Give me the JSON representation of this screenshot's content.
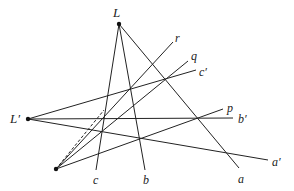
{
  "diagram": {
    "type": "projective-geometry-construction",
    "points": {
      "L": {
        "label": "L",
        "x": 119,
        "y": 24,
        "lx": 113,
        "ly": 17
      },
      "Lp": {
        "label": "L′",
        "x": 28,
        "y": 119,
        "lx": 10,
        "ly": 123
      },
      "O": {
        "label": "",
        "x": 56,
        "y": 169
      }
    },
    "lines": [
      {
        "id": "a",
        "label": "a",
        "from": "L",
        "x2": 239,
        "y2": 168,
        "lx": 238,
        "ly": 183
      },
      {
        "id": "b",
        "label": "b",
        "from": "L",
        "x2": 145,
        "y2": 170,
        "lx": 143,
        "ly": 184
      },
      {
        "id": "c",
        "label": "c",
        "from": "L",
        "x2": 96,
        "y2": 170,
        "lx": 93,
        "ly": 184
      },
      {
        "id": "a_prime",
        "label": "a′",
        "from": "Lp",
        "x2": 268,
        "y2": 160,
        "lx": 272,
        "ly": 166
      },
      {
        "id": "b_prime",
        "label": "b′",
        "from": "Lp",
        "x2": 233,
        "y2": 118,
        "lx": 238,
        "ly": 123
      },
      {
        "id": "c_prime",
        "label": "c′",
        "from": "Lp",
        "x2": 196,
        "y2": 70,
        "lx": 199,
        "ly": 76
      },
      {
        "id": "p",
        "label": "p",
        "from": "O",
        "x2": 223,
        "y2": 109,
        "lx": 227,
        "ly": 112
      },
      {
        "id": "q",
        "label": "q",
        "from": "O",
        "x2": 188,
        "y2": 61,
        "lx": 191,
        "ly": 60
      },
      {
        "id": "r",
        "label": "r",
        "from": "O",
        "x2": 173,
        "y2": 42,
        "lx": 175,
        "ly": 42
      }
    ],
    "dashed_segment": {
      "from": "O",
      "x2": 104,
      "y2": 110
    }
  }
}
